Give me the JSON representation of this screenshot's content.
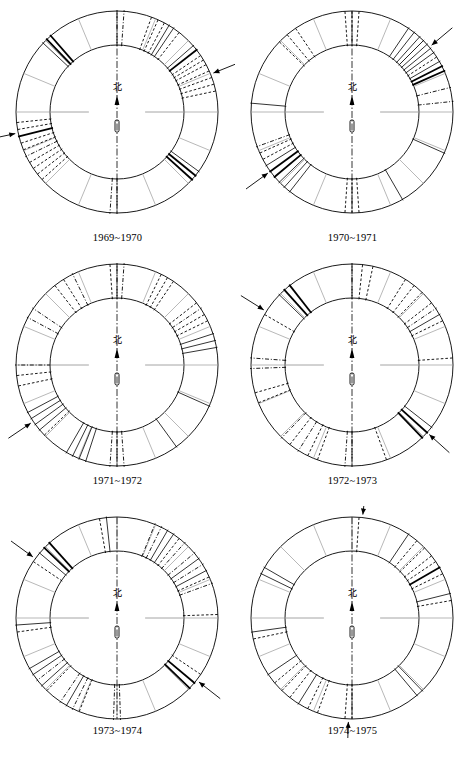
{
  "figure": {
    "kind": "six-panel ring (wind-rose style) diagram",
    "north_glyph": "北",
    "north_glyph_meaning": "north",
    "panel_count": 6,
    "sectors_per_ring": 16,
    "colors": {
      "ink": "#000000",
      "light_rule": "#9a9a9a",
      "background": "#ffffff"
    }
  },
  "panels": [
    {
      "id": "panel-1969-1970",
      "caption": "1969~1970",
      "north_label": "北",
      "arrows": [
        {
          "name": "arrow-upper-right",
          "angle_deg": 22,
          "side": "outside"
        },
        {
          "name": "arrow-bottom-left",
          "angle_deg": 192,
          "side": "outside"
        }
      ],
      "ring_marks": [
        {
          "angle_deg": 12,
          "style": "dashed"
        },
        {
          "angle_deg": 16,
          "style": "dashed"
        },
        {
          "angle_deg": 20,
          "style": "dashed"
        },
        {
          "angle_deg": 24,
          "style": "dashed"
        },
        {
          "angle_deg": 28,
          "style": "dashed"
        },
        {
          "angle_deg": 31,
          "style": "dashed"
        },
        {
          "angle_deg": 34,
          "style": "dashed"
        },
        {
          "angle_deg": 38,
          "style": "solid-thick"
        },
        {
          "angle_deg": 41,
          "style": "solid"
        },
        {
          "angle_deg": 52,
          "style": "dashed"
        },
        {
          "angle_deg": 56,
          "style": "solid"
        },
        {
          "angle_deg": 59,
          "style": "solid"
        },
        {
          "angle_deg": 62,
          "style": "dashed"
        },
        {
          "angle_deg": 66,
          "style": "dashed"
        },
        {
          "angle_deg": 70,
          "style": "dashed"
        },
        {
          "angle_deg": 86,
          "style": "dashdot"
        },
        {
          "angle_deg": 90,
          "style": "dashdot"
        },
        {
          "angle_deg": 131,
          "style": "solid-thick"
        },
        {
          "angle_deg": 134,
          "style": "solid-thick"
        },
        {
          "angle_deg": 137,
          "style": "solid"
        },
        {
          "angle_deg": 186,
          "style": "dashed"
        },
        {
          "angle_deg": 190,
          "style": "dashed"
        },
        {
          "angle_deg": 194,
          "style": "solid-thick"
        },
        {
          "angle_deg": 198,
          "style": "dashed"
        },
        {
          "angle_deg": 202,
          "style": "dashed"
        },
        {
          "angle_deg": 206,
          "style": "dashdot"
        },
        {
          "angle_deg": 210,
          "style": "dashed"
        },
        {
          "angle_deg": 214,
          "style": "dashed"
        },
        {
          "angle_deg": 218,
          "style": "dashed"
        },
        {
          "angle_deg": 222,
          "style": "dashed"
        },
        {
          "angle_deg": 266,
          "style": "dashdot"
        },
        {
          "angle_deg": 270,
          "style": "dashdot"
        },
        {
          "angle_deg": 318,
          "style": "solid-thick"
        },
        {
          "angle_deg": 321,
          "style": "solid-thick"
        },
        {
          "angle_deg": 324,
          "style": "solid"
        }
      ]
    },
    {
      "id": "panel-1970-1971",
      "caption": "1970~1971",
      "north_label": "北",
      "arrows": [
        {
          "name": "arrow-right-upper",
          "angle_deg": 40,
          "side": "outside"
        },
        {
          "name": "arrow-left-lower",
          "angle_deg": 216,
          "side": "outside"
        }
      ],
      "ring_marks": [
        {
          "angle_deg": 6,
          "style": "dashdot"
        },
        {
          "angle_deg": 14,
          "style": "dashdot"
        },
        {
          "angle_deg": 24,
          "style": "solid-thick"
        },
        {
          "angle_deg": 27,
          "style": "solid-thick"
        },
        {
          "angle_deg": 30,
          "style": "solid"
        },
        {
          "angle_deg": 33,
          "style": "dashed"
        },
        {
          "angle_deg": 36,
          "style": "solid"
        },
        {
          "angle_deg": 39,
          "style": "solid"
        },
        {
          "angle_deg": 42,
          "style": "solid"
        },
        {
          "angle_deg": 45,
          "style": "solid"
        },
        {
          "angle_deg": 48,
          "style": "solid"
        },
        {
          "angle_deg": 52,
          "style": "solid"
        },
        {
          "angle_deg": 56,
          "style": "solid"
        },
        {
          "angle_deg": 86,
          "style": "dashed"
        },
        {
          "angle_deg": 90,
          "style": "dashed"
        },
        {
          "angle_deg": 94,
          "style": "dashed"
        },
        {
          "angle_deg": 124,
          "style": "dashed"
        },
        {
          "angle_deg": 130,
          "style": "dashed"
        },
        {
          "angle_deg": 136,
          "style": "dashed"
        },
        {
          "angle_deg": 175,
          "style": "solid"
        },
        {
          "angle_deg": 200,
          "style": "dashdot"
        },
        {
          "angle_deg": 204,
          "style": "dashed"
        },
        {
          "angle_deg": 208,
          "style": "dashed"
        },
        {
          "angle_deg": 212,
          "style": "solid"
        },
        {
          "angle_deg": 216,
          "style": "solid-thick"
        },
        {
          "angle_deg": 220,
          "style": "solid-thick"
        },
        {
          "angle_deg": 224,
          "style": "solid"
        },
        {
          "angle_deg": 228,
          "style": "solid"
        },
        {
          "angle_deg": 232,
          "style": "solid"
        },
        {
          "angle_deg": 266,
          "style": "dashed"
        },
        {
          "angle_deg": 270,
          "style": "dashed"
        },
        {
          "angle_deg": 274,
          "style": "dashed"
        },
        {
          "angle_deg": 300,
          "style": "solid"
        },
        {
          "angle_deg": 336,
          "style": "solid"
        }
      ]
    },
    {
      "id": "panel-1971-1972",
      "caption": "1971~1972",
      "north_label": "北",
      "arrows": [
        {
          "name": "arrow-lower-left",
          "angle_deg": 214,
          "side": "outside"
        }
      ],
      "ring_marks": [
        {
          "angle_deg": 10,
          "style": "solid"
        },
        {
          "angle_deg": 14,
          "style": "solid"
        },
        {
          "angle_deg": 18,
          "style": "solid"
        },
        {
          "angle_deg": 26,
          "style": "dashed"
        },
        {
          "angle_deg": 30,
          "style": "dashed"
        },
        {
          "angle_deg": 34,
          "style": "dashdot"
        },
        {
          "angle_deg": 38,
          "style": "dashed"
        },
        {
          "angle_deg": 56,
          "style": "dashed"
        },
        {
          "angle_deg": 60,
          "style": "dashed"
        },
        {
          "angle_deg": 64,
          "style": "dashed"
        },
        {
          "angle_deg": 86,
          "style": "dashdot"
        },
        {
          "angle_deg": 90,
          "style": "dashdot"
        },
        {
          "angle_deg": 94,
          "style": "dashed"
        },
        {
          "angle_deg": 116,
          "style": "dashdot"
        },
        {
          "angle_deg": 122,
          "style": "dashed"
        },
        {
          "angle_deg": 128,
          "style": "dashed"
        },
        {
          "angle_deg": 146,
          "style": "dashdot"
        },
        {
          "angle_deg": 152,
          "style": "dashdot"
        },
        {
          "angle_deg": 180,
          "style": "dashdot"
        },
        {
          "angle_deg": 186,
          "style": "dashed"
        },
        {
          "angle_deg": 192,
          "style": "dashed"
        },
        {
          "angle_deg": 208,
          "style": "solid"
        },
        {
          "angle_deg": 212,
          "style": "solid"
        },
        {
          "angle_deg": 216,
          "style": "solid"
        },
        {
          "angle_deg": 220,
          "style": "solid"
        },
        {
          "angle_deg": 224,
          "style": "dashed"
        },
        {
          "angle_deg": 240,
          "style": "solid"
        },
        {
          "angle_deg": 244,
          "style": "solid"
        },
        {
          "angle_deg": 248,
          "style": "solid"
        },
        {
          "angle_deg": 252,
          "style": "solid"
        },
        {
          "angle_deg": 266,
          "style": "dashdot"
        },
        {
          "angle_deg": 270,
          "style": "dashdot"
        },
        {
          "angle_deg": 274,
          "style": "dashdot"
        },
        {
          "angle_deg": 306,
          "style": "solid"
        },
        {
          "angle_deg": 336,
          "style": "solid"
        }
      ]
    },
    {
      "id": "panel-1972-1973",
      "caption": "1972~1973",
      "north_label": "北",
      "arrows": [
        {
          "name": "arrow-upper-left",
          "angle_deg": 148,
          "side": "outside"
        },
        {
          "name": "arrow-lower-right",
          "angle_deg": 318,
          "side": "outside"
        }
      ],
      "ring_marks": [
        {
          "angle_deg": 4,
          "style": "dashed"
        },
        {
          "angle_deg": 26,
          "style": "dashed"
        },
        {
          "angle_deg": 30,
          "style": "solid"
        },
        {
          "angle_deg": 34,
          "style": "dashdot"
        },
        {
          "angle_deg": 38,
          "style": "dashed"
        },
        {
          "angle_deg": 46,
          "style": "dashed"
        },
        {
          "angle_deg": 52,
          "style": "dashed"
        },
        {
          "angle_deg": 58,
          "style": "dashed"
        },
        {
          "angle_deg": 78,
          "style": "dashed"
        },
        {
          "angle_deg": 84,
          "style": "dashed"
        },
        {
          "angle_deg": 90,
          "style": "dashdot"
        },
        {
          "angle_deg": 128,
          "style": "solid-thick"
        },
        {
          "angle_deg": 132,
          "style": "solid-thick"
        },
        {
          "angle_deg": 136,
          "style": "solid"
        },
        {
          "angle_deg": 150,
          "style": "dashed"
        },
        {
          "angle_deg": 176,
          "style": "dashdot"
        },
        {
          "angle_deg": 182,
          "style": "dashdot"
        },
        {
          "angle_deg": 196,
          "style": "dashed"
        },
        {
          "angle_deg": 202,
          "style": "dashed"
        },
        {
          "angle_deg": 226,
          "style": "dashdot"
        },
        {
          "angle_deg": 232,
          "style": "dashed"
        },
        {
          "angle_deg": 238,
          "style": "dashdot"
        },
        {
          "angle_deg": 244,
          "style": "dashed"
        },
        {
          "angle_deg": 250,
          "style": "dashed"
        },
        {
          "angle_deg": 266,
          "style": "dashdot"
        },
        {
          "angle_deg": 270,
          "style": "dashdot"
        },
        {
          "angle_deg": 290,
          "style": "dashed"
        },
        {
          "angle_deg": 314,
          "style": "solid-thick"
        },
        {
          "angle_deg": 318,
          "style": "solid-thick"
        },
        {
          "angle_deg": 322,
          "style": "solid"
        }
      ]
    },
    {
      "id": "panel-1973-1974",
      "caption": "1973~1974",
      "north_label": "北",
      "arrows": [
        {
          "name": "arrow-upper-left",
          "angle_deg": 144,
          "side": "outside"
        },
        {
          "name": "arrow-lower-right",
          "angle_deg": 322,
          "side": "outside"
        }
      ],
      "ring_marks": [
        {
          "angle_deg": 2,
          "style": "dashed"
        },
        {
          "angle_deg": 20,
          "style": "dashdot"
        },
        {
          "angle_deg": 24,
          "style": "dashed"
        },
        {
          "angle_deg": 28,
          "style": "solid"
        },
        {
          "angle_deg": 32,
          "style": "dashdot"
        },
        {
          "angle_deg": 36,
          "style": "solid"
        },
        {
          "angle_deg": 40,
          "style": "dashdot"
        },
        {
          "angle_deg": 48,
          "style": "dashdot"
        },
        {
          "angle_deg": 52,
          "style": "dashed"
        },
        {
          "angle_deg": 56,
          "style": "solid"
        },
        {
          "angle_deg": 60,
          "style": "solid"
        },
        {
          "angle_deg": 64,
          "style": "dashdot"
        },
        {
          "angle_deg": 68,
          "style": "dashdot"
        },
        {
          "angle_deg": 96,
          "style": "solid"
        },
        {
          "angle_deg": 100,
          "style": "dashed"
        },
        {
          "angle_deg": 132,
          "style": "solid-thick"
        },
        {
          "angle_deg": 136,
          "style": "solid-thick"
        },
        {
          "angle_deg": 140,
          "style": "solid"
        },
        {
          "angle_deg": 146,
          "style": "dashed"
        },
        {
          "angle_deg": 184,
          "style": "solid"
        },
        {
          "angle_deg": 188,
          "style": "dashed"
        },
        {
          "angle_deg": 210,
          "style": "solid"
        },
        {
          "angle_deg": 214,
          "style": "solid"
        },
        {
          "angle_deg": 218,
          "style": "dashdot"
        },
        {
          "angle_deg": 222,
          "style": "solid"
        },
        {
          "angle_deg": 226,
          "style": "dashed"
        },
        {
          "angle_deg": 236,
          "style": "dashdot"
        },
        {
          "angle_deg": 240,
          "style": "solid"
        },
        {
          "angle_deg": 244,
          "style": "dashdot"
        },
        {
          "angle_deg": 248,
          "style": "dashed"
        },
        {
          "angle_deg": 268,
          "style": "dashdot"
        },
        {
          "angle_deg": 272,
          "style": "dashdot"
        },
        {
          "angle_deg": 316,
          "style": "solid-thick"
        },
        {
          "angle_deg": 320,
          "style": "solid-thick"
        },
        {
          "angle_deg": 326,
          "style": "dashed"
        }
      ]
    },
    {
      "id": "panel-1974-1975",
      "caption": "1974~1975",
      "north_label": "北",
      "arrows": [
        {
          "name": "arrow-top",
          "angle_deg": 84,
          "side": "outside"
        },
        {
          "name": "arrow-bottom",
          "angle_deg": 268,
          "side": "outside"
        }
      ],
      "ring_marks": [
        {
          "angle_deg": 86,
          "style": "dashed"
        },
        {
          "angle_deg": 26,
          "style": "dashed"
        },
        {
          "angle_deg": 30,
          "style": "solid-thick"
        },
        {
          "angle_deg": 34,
          "style": "dashed"
        },
        {
          "angle_deg": 38,
          "style": "dashed"
        },
        {
          "angle_deg": 44,
          "style": "dashed"
        },
        {
          "angle_deg": 50,
          "style": "dashed"
        },
        {
          "angle_deg": 56,
          "style": "solid"
        },
        {
          "angle_deg": 14,
          "style": "solid"
        },
        {
          "angle_deg": 10,
          "style": "dashed"
        },
        {
          "angle_deg": 150,
          "style": "solid"
        },
        {
          "angle_deg": 154,
          "style": "solid"
        },
        {
          "angle_deg": 188,
          "style": "solid"
        },
        {
          "angle_deg": 192,
          "style": "dashed"
        },
        {
          "angle_deg": 214,
          "style": "solid"
        },
        {
          "angle_deg": 220,
          "style": "dashed"
        },
        {
          "angle_deg": 226,
          "style": "dashed"
        },
        {
          "angle_deg": 232,
          "style": "dashed"
        },
        {
          "angle_deg": 238,
          "style": "solid"
        },
        {
          "angle_deg": 244,
          "style": "dashed"
        },
        {
          "angle_deg": 250,
          "style": "dashed"
        },
        {
          "angle_deg": 266,
          "style": "dashed"
        },
        {
          "angle_deg": 270,
          "style": "dashed"
        },
        {
          "angle_deg": 310,
          "style": "solid"
        },
        {
          "angle_deg": 314,
          "style": "solid"
        }
      ]
    }
  ]
}
